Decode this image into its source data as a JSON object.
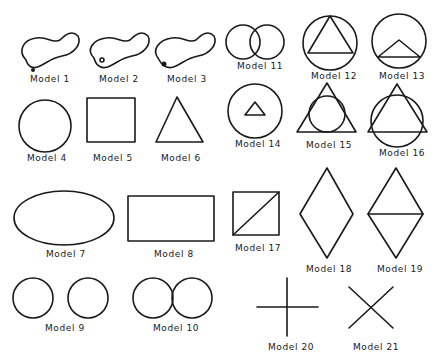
{
  "figure": {
    "type": "diagram",
    "ink_color": "#1a1a1a",
    "background": "#ffffff"
  },
  "models": [
    {
      "id": 1,
      "label": "Model 1",
      "shape": "peanut-shaped closed curve with small dot below-left"
    },
    {
      "id": 2,
      "label": "Model 2",
      "shape": "peanut-shaped closed curve with small circle inside lower-left"
    },
    {
      "id": 3,
      "label": "Model 3",
      "shape": "peanut-shaped closed curve with small circle on the outline"
    },
    {
      "id": 4,
      "label": "Model 4",
      "shape": "circle"
    },
    {
      "id": 5,
      "label": "Model 5",
      "shape": "square"
    },
    {
      "id": 6,
      "label": "Model 6",
      "shape": "triangle"
    },
    {
      "id": 7,
      "label": "Model 7",
      "shape": "ellipse"
    },
    {
      "id": 8,
      "label": "Model 8",
      "shape": "rectangle"
    },
    {
      "id": 9,
      "label": "Model 9",
      "shape": "two separate circles"
    },
    {
      "id": 10,
      "label": "Model 10",
      "shape": "two touching circles"
    },
    {
      "id": 11,
      "label": "Model 11",
      "shape": "two overlapping circles"
    },
    {
      "id": 12,
      "label": "Model 12",
      "shape": "triangle inscribed in circle"
    },
    {
      "id": 13,
      "label": "Model 13",
      "shape": "flat triangle inside circle touching bottom arc"
    },
    {
      "id": 14,
      "label": "Model 14",
      "shape": "small triangle centered in circle"
    },
    {
      "id": 15,
      "label": "Model 15",
      "shape": "circle inscribed in triangle"
    },
    {
      "id": 16,
      "label": "Model 16",
      "shape": "triangle overlapping circle"
    },
    {
      "id": 17,
      "label": "Model 17",
      "shape": "square with diagonal"
    },
    {
      "id": 18,
      "label": "Model 18",
      "shape": "diamond"
    },
    {
      "id": 19,
      "label": "Model 19",
      "shape": "diamond with horizontal diagonal"
    },
    {
      "id": 20,
      "label": "Model 20",
      "shape": "plus cross"
    },
    {
      "id": 21,
      "label": "Model 21",
      "shape": "diagonal X cross"
    }
  ]
}
